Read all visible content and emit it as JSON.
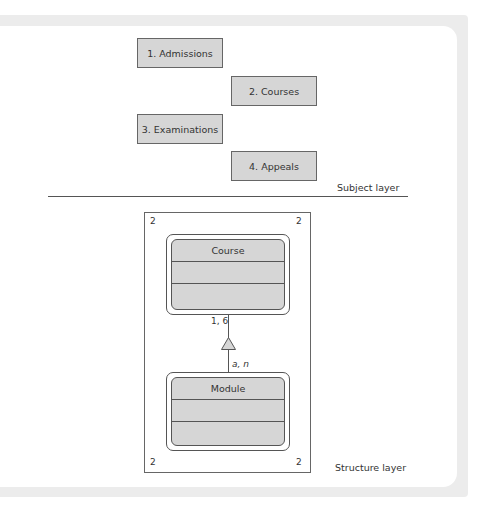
{
  "subject_layer": {
    "label": "Subject layer",
    "subjects": [
      {
        "label": "1. Admissions"
      },
      {
        "label": "2. Courses"
      },
      {
        "label": "3. Examinations"
      },
      {
        "label": "4. Appeals"
      }
    ]
  },
  "structure_layer": {
    "label": "Structure layer",
    "corner_numbers": [
      "2",
      "2",
      "2",
      "2"
    ],
    "classes": [
      {
        "name": "Course"
      },
      {
        "name": "Module"
      }
    ],
    "association": {
      "upper_multiplicity": "1, 6",
      "lower_multiplicity": "a, n"
    }
  },
  "colors": {
    "box_fill": "#d6d6d6",
    "border": "#555555",
    "frame": "#ececec"
  }
}
